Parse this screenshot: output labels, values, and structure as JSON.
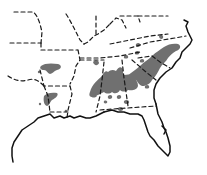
{
  "map": {
    "title": "",
    "description": "Outline map of the southeastern United States with dashed state boundaries, solid coastline, and gray shaded areas",
    "colors": {
      "background": "#ffffff",
      "border": "#1a1a1a",
      "coast": "#111111",
      "shaded_region": "#707070"
    },
    "legend": [],
    "labels": []
  }
}
